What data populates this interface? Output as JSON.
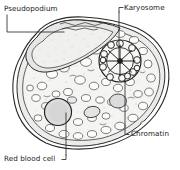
{
  "figure": {
    "background_color": "#ffffff",
    "ink_color": "#1a1a1a",
    "cytoplasm_color": "#f2f2f0",
    "ectoplasm_color": "#e8e8e6",
    "vacuole_color": "#fbfbfa",
    "rbc_color": "#dedede",
    "nucleus_color": "#f5f5f4"
  },
  "labels": {
    "pseudopodium": "Pseudopodium",
    "karyosome": "Karyosome",
    "chromatin": "Chromatin",
    "red_blood_cell": "Red blood cell"
  },
  "structures": [
    {
      "name": "pseudopodium",
      "label": "Pseudopodium",
      "position": "top-left lobe",
      "leader_to": [
        90,
        30
      ]
    },
    {
      "name": "karyosome",
      "label": "Karyosome",
      "position": "center of nucleus",
      "leader_to": [
        120,
        61
      ]
    },
    {
      "name": "chromatin",
      "label": "Chromatin",
      "position": "nuclear membrane",
      "leader_to": [
        121,
        78
      ]
    },
    {
      "name": "red-blood-cell",
      "label": "Red blood cell",
      "position": "lower-left cytoplasm",
      "leader_to": [
        58,
        112
      ]
    }
  ]
}
